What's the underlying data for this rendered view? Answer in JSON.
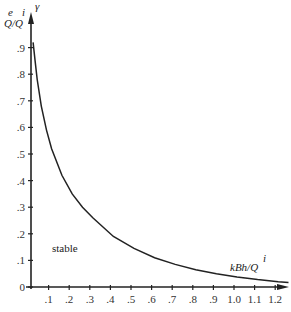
{
  "chart_data": {
    "type": "line",
    "title": "",
    "xlabel": "kBh/Q^i",
    "ylabel": "Q^e/Q^i",
    "y_axis_symbol": "γ",
    "xlim": [
      0,
      1.25
    ],
    "ylim": [
      0,
      1.0
    ],
    "grid": false,
    "legend": null,
    "x_ticks": [
      ".1",
      ".2",
      ".3",
      ".4",
      ".5",
      ".6",
      ".7",
      ".8",
      ".9",
      "1.0",
      "1.1",
      "1.2"
    ],
    "y_ticks": [
      "0",
      ".1",
      ".2",
      ".3",
      ".4",
      ".5",
      ".6",
      ".7",
      ".8",
      ".9"
    ],
    "annotations": [
      {
        "text": "stable",
        "x": 0.12,
        "y": 0.1
      }
    ],
    "series": [
      {
        "name": "stability boundary",
        "x": [
          0.01,
          0.02,
          0.03,
          0.05,
          0.075,
          0.1,
          0.15,
          0.2,
          0.25,
          0.3,
          0.4,
          0.5,
          0.6,
          0.7,
          0.8,
          0.9,
          1.0,
          1.1,
          1.2,
          1.25
        ],
        "y": [
          0.92,
          0.85,
          0.78,
          0.68,
          0.59,
          0.52,
          0.42,
          0.35,
          0.3,
          0.26,
          0.19,
          0.145,
          0.11,
          0.085,
          0.065,
          0.05,
          0.038,
          0.028,
          0.02,
          0.017
        ]
      }
    ]
  },
  "labels": {
    "y_axis_numerator": "e",
    "y_axis_denominator_sup": "i",
    "y_axis_text": "Q/Q",
    "gamma": "γ",
    "x_axis_text": "kBh/Q",
    "x_axis_sup": "i",
    "region": "stable"
  }
}
